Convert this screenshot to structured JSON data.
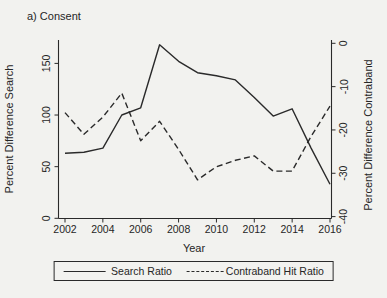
{
  "chart_data": {
    "type": "line",
    "title": "a) Consent",
    "xlabel": "Year",
    "x": [
      2002,
      2003,
      2004,
      2005,
      2006,
      2007,
      2008,
      2009,
      2010,
      2011,
      2012,
      2013,
      2014,
      2015,
      2016
    ],
    "x_ticks": [
      2002,
      2004,
      2006,
      2008,
      2010,
      2012,
      2014,
      2016
    ],
    "left_axis": {
      "label": "Percent Difference Search",
      "ticks": [
        0,
        50,
        100,
        150
      ],
      "range": [
        0,
        172.5
      ]
    },
    "right_axis": {
      "label": "Percent Difference Contraband",
      "ticks": [
        0,
        -10,
        -20,
        -30,
        -40
      ],
      "range": [
        0.8,
        -40.5
      ]
    },
    "grid": false,
    "series": [
      {
        "name": "Search Ratio",
        "axis": "left",
        "style": "solid",
        "values": [
          63,
          64,
          68,
          100,
          107,
          168,
          152,
          141,
          138,
          134,
          117,
          99,
          106,
          68,
          33
        ]
      },
      {
        "name": "Contraband Hit Ratio",
        "axis": "right",
        "style": "dashed",
        "values": [
          -16,
          -21,
          -17,
          -11.5,
          -22.5,
          -18,
          -24.5,
          -31.5,
          -28.5,
          -27,
          -26,
          -29.5,
          -29.5,
          -21.5,
          -14.5
        ]
      }
    ],
    "legend": {
      "position": "bottom",
      "entries": [
        "Search Ratio",
        "Contraband Hit Ratio"
      ]
    }
  },
  "colors": {
    "line": "#2a2a2a",
    "text": "#262626",
    "background": "#f2f2ef"
  }
}
